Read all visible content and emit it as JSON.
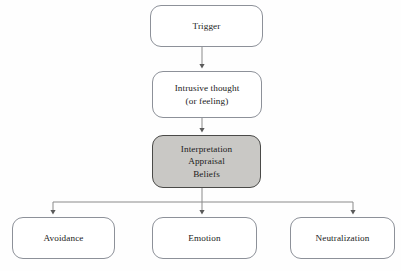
{
  "diagram": {
    "background_color": "#fefefe",
    "edge_color": "#8a8a8a",
    "shaded_fill": "#c9c8c5",
    "border_color": "#8d9199",
    "shaded_border_color": "#4a4a48",
    "nodes": [
      {
        "id": "trigger",
        "label": "Trigger",
        "shape": "rounded-rectangle",
        "shaded": false,
        "x": 150,
        "y": 5,
        "w": 113,
        "h": 42
      },
      {
        "id": "intrusive-thought",
        "label": "Intrusive thought\n(or feeling)",
        "shape": "rounded-rectangle",
        "shaded": false,
        "x": 152,
        "y": 71,
        "w": 110,
        "h": 47
      },
      {
        "id": "interpretation",
        "label": "Interpretation\nAppraisal\nBeliefs",
        "shape": "rounded-rectangle",
        "shaded": true,
        "x": 152,
        "y": 135,
        "w": 109,
        "h": 53
      },
      {
        "id": "avoidance",
        "label": "Avoidance",
        "shape": "rounded-rectangle",
        "shaded": false,
        "x": 12,
        "y": 217,
        "w": 103,
        "h": 42
      },
      {
        "id": "emotion",
        "label": "Emotion",
        "shape": "rounded-rectangle",
        "shaded": false,
        "x": 152,
        "y": 217,
        "w": 105,
        "h": 42
      },
      {
        "id": "neutralization",
        "label": "Neutralization",
        "shape": "rounded-rectangle",
        "shaded": false,
        "x": 290,
        "y": 217,
        "w": 105,
        "h": 42
      }
    ],
    "edges": [
      {
        "id": "trigger-to-intrusive",
        "from": "trigger",
        "to": "intrusive-thought",
        "arrowhead": true
      },
      {
        "id": "intrusive-to-interpretation",
        "from": "intrusive-thought",
        "to": "interpretation",
        "arrowhead": true
      },
      {
        "id": "interpretation-to-avoidance",
        "from": "interpretation",
        "to": "avoidance",
        "arrowhead": true
      },
      {
        "id": "interpretation-to-emotion",
        "from": "interpretation",
        "to": "emotion",
        "arrowhead": true
      },
      {
        "id": "interpretation-to-neutralization",
        "from": "interpretation",
        "to": "neutralization",
        "arrowhead": true
      }
    ]
  }
}
